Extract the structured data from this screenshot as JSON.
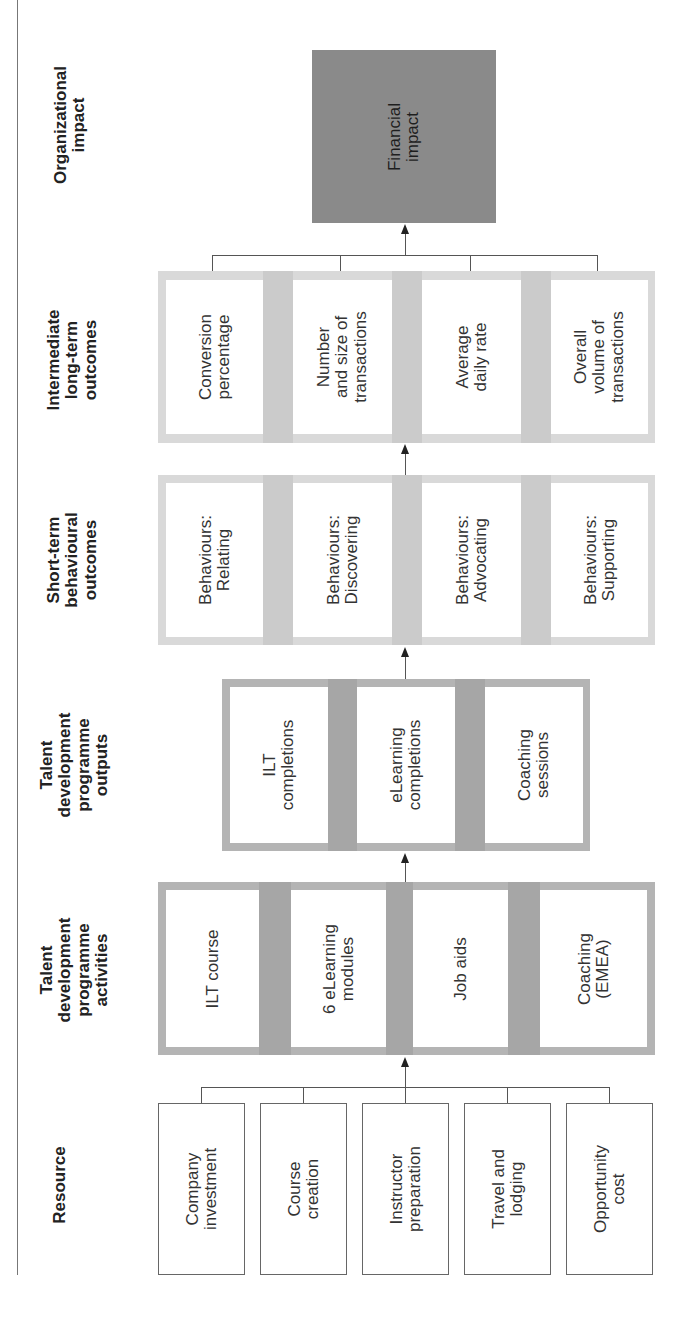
{
  "diagram": {
    "orientation": "rotated-90-ccw",
    "stages": [
      {
        "key": "resource",
        "label": "Resource"
      },
      {
        "key": "activities",
        "label": "Talent\ndevelopment\nprogramme\nactivities"
      },
      {
        "key": "outputs",
        "label": "Talent\ndevelopment\nprogramme\noutputs"
      },
      {
        "key": "short_term",
        "label": "Short-term\nbehavioural\noutcomes"
      },
      {
        "key": "intermediate",
        "label": "Intermediate\nlong-term\noutcomes"
      },
      {
        "key": "impact",
        "label": "Organizational\nimpact"
      }
    ],
    "resource": {
      "items": [
        "Company\ninvestment",
        "Course\ncreation",
        "Instructor\npreparation",
        "Travel and\nlodging",
        "Opportunity\ncost"
      ]
    },
    "activities": {
      "items": [
        "ILT course",
        "6 eLearning\nmodules",
        "Job aids",
        "Coaching\n(EMEA)"
      ]
    },
    "outputs": {
      "items": [
        "ILT\ncompletions",
        "eLearning\ncompletions",
        "Coaching\nsessions"
      ]
    },
    "short_term": {
      "items": [
        "Behaviours:\nRelating",
        "Behaviours:\nDiscovering",
        "Behaviours:\nAdvocating",
        "Behaviours:\nSupporting"
      ]
    },
    "intermediate": {
      "items": [
        "Conversion\npercentage",
        "Number\nand size of\ntransactions",
        "Average\ndaily rate",
        "Overall\nvolume of\ntransactions"
      ]
    },
    "impact": {
      "items": [
        "Financial\nimpact"
      ]
    },
    "colors": {
      "impact_fill": "#8a8a8a",
      "dark_block": "#b4b4b4",
      "dark_block_gap": "#a6a6a6",
      "light_block": "#d9d9d9",
      "light_block_gap": "#cbcbcb",
      "line": "#555555"
    }
  }
}
